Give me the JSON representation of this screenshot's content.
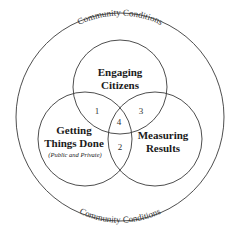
{
  "diagram": {
    "type": "venn",
    "outer": {
      "label_top": "Community Conditions",
      "label_bottom": "Community Conditions"
    },
    "circles": [
      {
        "id": "top",
        "lines": [
          "Engaging",
          "Citizens"
        ],
        "sub": ""
      },
      {
        "id": "left",
        "lines": [
          "Getting",
          "Things Done"
        ],
        "sub": "(Public and Private)"
      },
      {
        "id": "right",
        "lines": [
          "Measuring",
          "Results"
        ],
        "sub": ""
      }
    ],
    "regions": {
      "top_left": "1",
      "left_right": "2",
      "top_right": "3",
      "center": "4"
    },
    "colors": {
      "stroke": "#3a3a3a",
      "text": "#1a1a1a",
      "background": "#ffffff"
    }
  }
}
